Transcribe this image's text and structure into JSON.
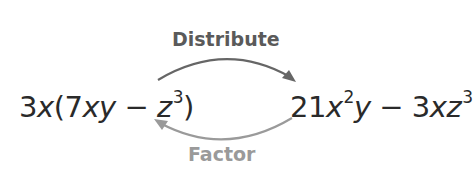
{
  "diagram": {
    "left_expression": {
      "coef": "3",
      "var1": "x",
      "open": "(7",
      "var2": "xy",
      "minus": " − ",
      "var3": "z",
      "exp": "3",
      "close": ")"
    },
    "right_expression": {
      "coef": "21",
      "var1": "x",
      "exp1": "2",
      "var2": "y",
      "minus": " − ",
      "coef2": "3",
      "var3": "xz",
      "exp2": "3"
    },
    "top_arrow": {
      "label": "Distribute",
      "direction": "left-to-right",
      "color": "#666666",
      "label_color": "#5a5a5a"
    },
    "bottom_arrow": {
      "label": "Factor",
      "direction": "right-to-left",
      "color": "#9a9a9a",
      "label_color": "#9a9a9a"
    }
  }
}
